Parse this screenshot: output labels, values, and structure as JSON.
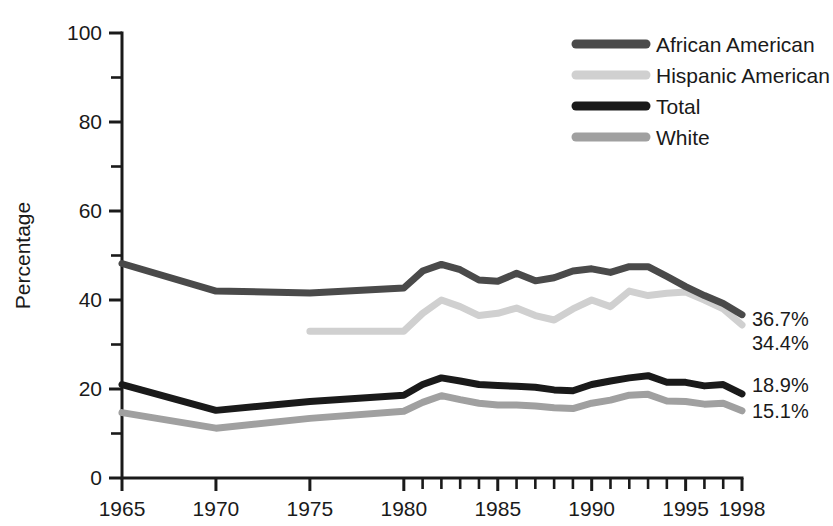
{
  "chart_data": {
    "type": "line",
    "title": "",
    "xlabel": "",
    "ylabel": "Percentage",
    "xlim": [
      1965,
      1998
    ],
    "ylim": [
      0,
      100
    ],
    "grid": false,
    "legend_position": "top-right",
    "y_ticks_labeled": [
      0,
      20,
      40,
      60,
      80,
      100
    ],
    "y_ticks_minor": [
      10,
      30,
      50,
      70,
      90
    ],
    "x_ticks_labeled": [
      1965,
      1970,
      1975,
      1980,
      1985,
      1990,
      1995,
      1998
    ],
    "x_ticks_minor": [
      1981,
      1982,
      1983,
      1984,
      1986,
      1987,
      1988,
      1989,
      1991,
      1992,
      1993,
      1994,
      1996,
      1997
    ],
    "series": [
      {
        "name": "African American",
        "color": "#4a4a4a",
        "x": [
          1965,
          1970,
          1975,
          1980,
          1981,
          1982,
          1983,
          1984,
          1985,
          1986,
          1987,
          1988,
          1989,
          1990,
          1991,
          1992,
          1993,
          1994,
          1995,
          1996,
          1997,
          1998
        ],
        "values": [
          48.2,
          42.0,
          41.6,
          42.7,
          46.5,
          48.0,
          46.8,
          44.5,
          44.2,
          46.0,
          44.3,
          45.0,
          46.5,
          47.0,
          46.2,
          47.5,
          47.5,
          45.3,
          43.0,
          41.0,
          39.2,
          36.7
        ],
        "endpoint_label": "36.7%"
      },
      {
        "name": "Hispanic American",
        "color": "#d0d0d0",
        "x": [
          1975,
          1980,
          1981,
          1982,
          1983,
          1984,
          1985,
          1986,
          1987,
          1988,
          1989,
          1990,
          1991,
          1992,
          1993,
          1994,
          1995,
          1996,
          1997,
          1998
        ],
        "values": [
          33.0,
          33.0,
          37.0,
          40.0,
          38.5,
          36.5,
          37.0,
          38.2,
          36.5,
          35.5,
          38.0,
          40.0,
          38.5,
          42.0,
          41.0,
          41.5,
          41.8,
          40.0,
          38.0,
          34.4
        ],
        "endpoint_label": "34.4%"
      },
      {
        "name": "Total",
        "color": "#1a1a1a",
        "x": [
          1965,
          1970,
          1975,
          1980,
          1981,
          1982,
          1983,
          1984,
          1985,
          1986,
          1987,
          1988,
          1989,
          1990,
          1991,
          1992,
          1993,
          1994,
          1995,
          1996,
          1997,
          1998
        ],
        "values": [
          21.0,
          15.2,
          17.2,
          18.6,
          21.0,
          22.5,
          21.8,
          21.0,
          20.8,
          20.6,
          20.4,
          19.8,
          19.6,
          21.0,
          21.8,
          22.5,
          23.0,
          21.5,
          21.5,
          20.7,
          21.0,
          18.9
        ],
        "endpoint_label": "18.9%"
      },
      {
        "name": "White",
        "color": "#a0a0a0",
        "x": [
          1965,
          1970,
          1975,
          1980,
          1981,
          1982,
          1983,
          1984,
          1985,
          1986,
          1987,
          1988,
          1989,
          1990,
          1991,
          1992,
          1993,
          1994,
          1995,
          1996,
          1997,
          1998
        ],
        "values": [
          14.7,
          11.2,
          13.4,
          15.0,
          17.0,
          18.5,
          17.6,
          16.8,
          16.4,
          16.4,
          16.2,
          15.8,
          15.6,
          16.8,
          17.5,
          18.6,
          18.8,
          17.3,
          17.2,
          16.6,
          16.8,
          15.1
        ],
        "endpoint_label": "15.1%"
      }
    ]
  },
  "axes": {
    "ylabel": "Percentage",
    "y_tick_labels": [
      "0",
      "20",
      "40",
      "60",
      "80",
      "100"
    ],
    "x_tick_labels": [
      "1965",
      "1970",
      "1975",
      "1980",
      "1985",
      "1990",
      "1995",
      "1998"
    ]
  },
  "legend": {
    "items": [
      {
        "label": "African American",
        "color": "#4a4a4a"
      },
      {
        "label": "Hispanic American",
        "color": "#d0d0d0"
      },
      {
        "label": "Total",
        "color": "#1a1a1a"
      },
      {
        "label": "White",
        "color": "#a0a0a0"
      }
    ]
  },
  "endpoint_labels": [
    {
      "text": "36.7%"
    },
    {
      "text": "34.4%"
    },
    {
      "text": "18.9%"
    },
    {
      "text": "15.1%"
    }
  ]
}
